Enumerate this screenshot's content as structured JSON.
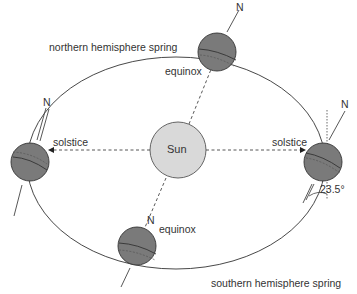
{
  "diagram": {
    "sun_label": "Sun",
    "labels": {
      "northern_spring": "northern hemisphere spring",
      "southern_spring": "southern hemisphere spring",
      "equinox_top": "equinox",
      "equinox_bottom": "equinox",
      "solstice_left": "solstice",
      "solstice_right": "solstice",
      "tilt_angle": "23.5°"
    },
    "north_labels": [
      "N",
      "N",
      "N",
      "N"
    ],
    "colors": {
      "earth_fill": "#7a7a7a",
      "sun_fill": "#d9d9d9",
      "line": "#333333"
    }
  }
}
